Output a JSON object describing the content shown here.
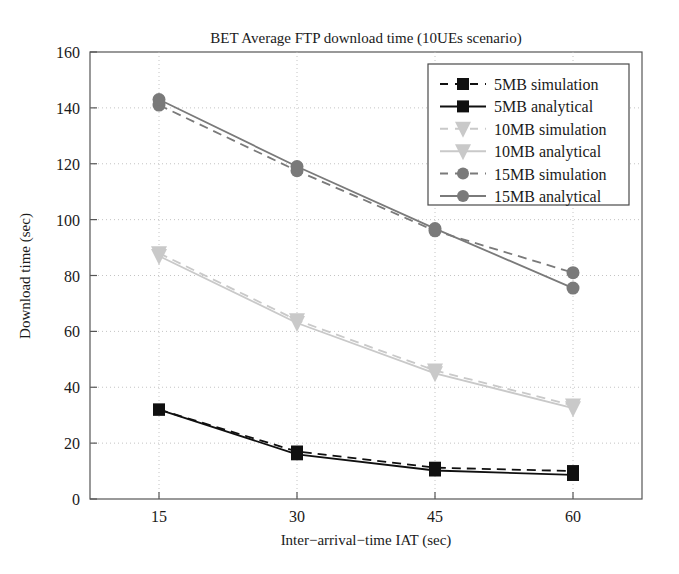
{
  "chart_data": {
    "type": "line",
    "title": "BET Average FTP download time (10UEs scenario)",
    "xlabel": "Inter−arrival−time IAT (sec)",
    "ylabel": "Download time (sec)",
    "x": [
      15,
      30,
      45,
      60
    ],
    "xticklabels": [
      "15",
      "30",
      "45",
      "60"
    ],
    "yticklabels": [
      "0",
      "20",
      "40",
      "60",
      "80",
      "100",
      "120",
      "140",
      "160"
    ],
    "yticks": [
      0,
      20,
      40,
      60,
      80,
      100,
      120,
      140,
      160
    ],
    "xlim": [
      7.5,
      67.5
    ],
    "ylim": [
      0,
      160
    ],
    "grid": "dotted",
    "legend_position": "top-right",
    "series": [
      {
        "name": "5MB simulation",
        "values": [
          32.0,
          17.0,
          11.2,
          10.0
        ],
        "color": "#101010",
        "marker": "square",
        "linestyle": "dashed"
      },
      {
        "name": "5MB analytical",
        "values": [
          32.0,
          16.0,
          10.2,
          8.6
        ],
        "color": "#101010",
        "marker": "square",
        "linestyle": "solid"
      },
      {
        "name": "10MB simulation",
        "values": [
          88.0,
          64.0,
          46.0,
          33.5
        ],
        "color": "#c9c9c9",
        "marker": "triangle-down",
        "linestyle": "dashed"
      },
      {
        "name": "10MB analytical",
        "values": [
          87.0,
          63.0,
          45.0,
          32.5
        ],
        "color": "#c9c9c9",
        "marker": "triangle-down",
        "linestyle": "solid"
      },
      {
        "name": "15MB simulation",
        "values": [
          141.0,
          117.5,
          96.0,
          81.0
        ],
        "color": "#7a7a7a",
        "marker": "circle",
        "linestyle": "dashed"
      },
      {
        "name": "15MB analytical",
        "values": [
          143.0,
          119.0,
          96.8,
          75.5
        ],
        "color": "#7a7a7a",
        "marker": "circle",
        "linestyle": "solid"
      }
    ]
  },
  "legend": {
    "entries": [
      {
        "label": "5MB simulation"
      },
      {
        "label": "5MB analytical"
      },
      {
        "label": "10MB simulation"
      },
      {
        "label": "10MB analytical"
      },
      {
        "label": "15MB simulation"
      },
      {
        "label": "15MB analytical"
      }
    ]
  },
  "axes": {
    "title": "BET Average FTP download time (10UEs scenario)",
    "xlabel": "Inter−arrival−time IAT (sec)",
    "ylabel": "Download time (sec)",
    "xticks": [
      "15",
      "30",
      "45",
      "60"
    ],
    "yticks": [
      "0",
      "20",
      "40",
      "60",
      "80",
      "100",
      "120",
      "140",
      "160"
    ]
  },
  "colors": {
    "axis": "#555555",
    "grid": "#bdbdbd",
    "series_5mb": "#101010",
    "series_10mb": "#c9c9c9",
    "series_15mb": "#7a7a7a",
    "background": "#ffffff"
  }
}
